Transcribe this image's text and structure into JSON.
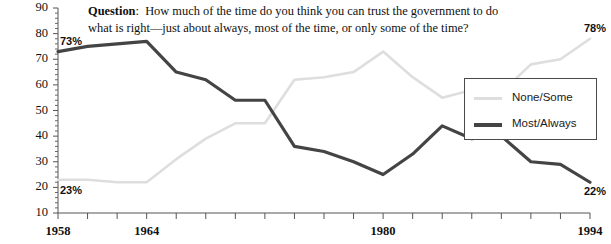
{
  "question": {
    "prefix": "Question",
    "separator": ":",
    "body": "How much of the time do you think you can trust the government to do what is right—just about always, most of the time, or only some of the time?"
  },
  "legend": {
    "position": "right-middle",
    "items": [
      {
        "label": "None/Some",
        "color": "#dedede"
      },
      {
        "label": "Most/Always",
        "color": "#444444"
      }
    ]
  },
  "annotations": [
    {
      "name": "start-most-always",
      "text": "73%",
      "x": 1958,
      "y": 73
    },
    {
      "name": "start-none-some",
      "text": "23%",
      "x": 1958,
      "y": 23
    },
    {
      "name": "end-none-some",
      "text": "78%",
      "x": 1994,
      "y": 78
    },
    {
      "name": "end-most-always",
      "text": "22%",
      "x": 1994,
      "y": 22
    }
  ],
  "axes": {
    "y_ticks": [
      90,
      80,
      70,
      60,
      50,
      40,
      30,
      20,
      10
    ],
    "y_labels": [
      "90",
      "80",
      "70",
      "60",
      "50",
      "40",
      "30",
      "20",
      "10"
    ],
    "ylim": [
      10,
      90
    ],
    "y_minor_step": 2,
    "xlim": [
      1958,
      1994
    ],
    "x_tick_step": 2,
    "x_labeled": [
      "1958",
      "1964",
      "1980",
      "1994"
    ],
    "x_labeled_years": [
      1958,
      1964,
      1980,
      1994
    ],
    "grid": false
  },
  "chart_data": {
    "type": "line",
    "title": "",
    "subtitle": "",
    "xlabel": "",
    "ylabel": "",
    "xlim": [
      1958,
      1994
    ],
    "ylim": [
      10,
      90
    ],
    "grid": false,
    "legend_position": "right-middle",
    "x": [
      1958,
      1960,
      1962,
      1964,
      1966,
      1968,
      1970,
      1972,
      1974,
      1976,
      1978,
      1980,
      1982,
      1984,
      1986,
      1988,
      1990,
      1992,
      1994
    ],
    "series": [
      {
        "name": "None/Some",
        "color": "#dedede",
        "values": [
          23,
          23,
          22,
          22,
          31,
          39,
          45,
          45,
          62,
          63,
          65,
          73,
          63,
          55,
          58,
          57,
          68,
          70,
          78
        ]
      },
      {
        "name": "Most/Always",
        "color": "#444444",
        "values": [
          73,
          75,
          76,
          77,
          65,
          62,
          54,
          54,
          36,
          34,
          30,
          25,
          33,
          44,
          39,
          40,
          30,
          29,
          22
        ]
      }
    ],
    "annotations": [
      {
        "text": "73%",
        "x": 1958,
        "y": 73,
        "series": "Most/Always"
      },
      {
        "text": "23%",
        "x": 1958,
        "y": 23,
        "series": "None/Some"
      },
      {
        "text": "78%",
        "x": 1994,
        "y": 78,
        "series": "None/Some"
      },
      {
        "text": "22%",
        "x": 1994,
        "y": 22,
        "series": "Most/Always"
      }
    ]
  }
}
